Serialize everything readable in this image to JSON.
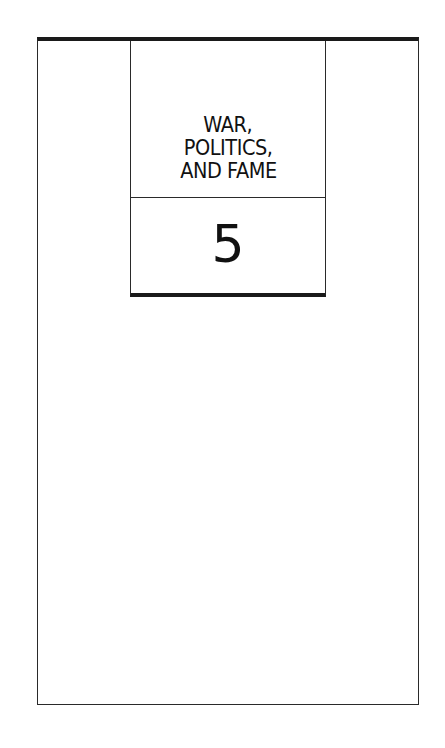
{
  "page": {
    "chapter": {
      "title_lines": [
        "WAR,",
        "POLITICS,",
        "AND FAME"
      ],
      "number": "5"
    }
  }
}
